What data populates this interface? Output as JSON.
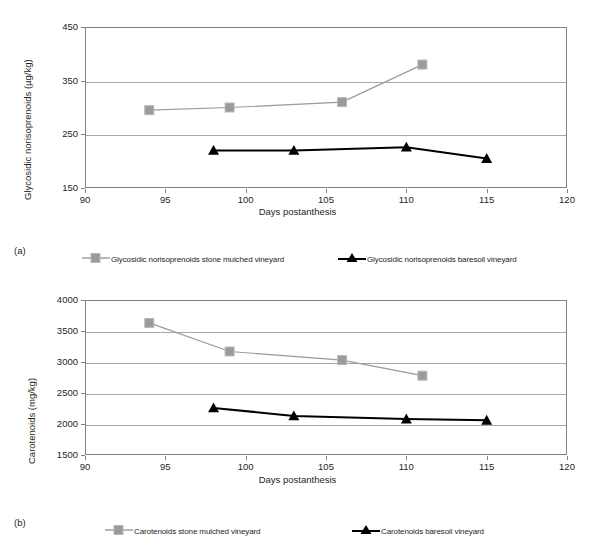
{
  "page_header": ". .                                                                  ..",
  "figures": [
    {
      "panel_letter": "(a)",
      "chart_data": {
        "type": "line",
        "title": "",
        "xlabel": "Days postanthesis",
        "ylabel": "Glycosidic norisoprenoids  (µg/kg)",
        "xlim": [
          90,
          120
        ],
        "ylim": [
          150,
          450
        ],
        "xticks": [
          90,
          95,
          100,
          105,
          110,
          115,
          120
        ],
        "yticks": [
          150,
          250,
          350,
          450
        ],
        "grid": true,
        "legend_position": "bottom",
        "series": [
          {
            "name": "Glycosidic norisoprenoids stone mulched vineyard",
            "color": "#9a9a9a",
            "marker": "square",
            "x": [
              94,
              99,
              106,
              111
            ],
            "values": [
              295,
              300,
              310,
              380
            ]
          },
          {
            "name": "Glycosidic norisoprenoids baresoil vineyard",
            "color": "#000000",
            "marker": "triangle",
            "x": [
              98,
              103,
              110,
              115
            ],
            "values": [
              220,
              220,
              226,
              205
            ]
          }
        ]
      }
    },
    {
      "panel_letter": "(b)",
      "chart_data": {
        "type": "line",
        "title": "",
        "xlabel": "Days postanthesis",
        "ylabel": "Carotenoids (mg/kg)",
        "xlim": [
          90,
          120
        ],
        "ylim": [
          1500,
          4000
        ],
        "xticks": [
          90,
          95,
          100,
          105,
          110,
          115,
          120
        ],
        "yticks": [
          1500,
          2000,
          2500,
          3000,
          3500,
          4000
        ],
        "grid": true,
        "legend_position": "bottom",
        "series": [
          {
            "name": "Carotenoids stone mulched vineyard",
            "color": "#9a9a9a",
            "marker": "square",
            "x": [
              94,
              99,
              106,
              111
            ],
            "values": [
              3630,
              3170,
              3030,
              2780
            ]
          },
          {
            "name": "Carotenoids baresoil vineyard",
            "color": "#000000",
            "marker": "triangle",
            "x": [
              98,
              103,
              110,
              115
            ],
            "values": [
              2260,
              2130,
              2080,
              2060
            ]
          }
        ]
      }
    }
  ]
}
